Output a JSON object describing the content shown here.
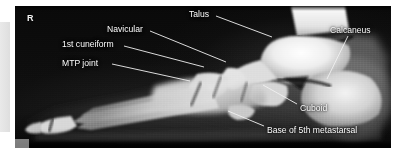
{
  "figure": {
    "modality": "radiograph",
    "view": "lateral foot",
    "side_marker": "R",
    "label_color": "#fdfdfd",
    "leader_color": "#f0f0f0",
    "film_background": "#0a0a0a",
    "bone_color": "#e8e8e8"
  },
  "annotations": [
    {
      "id": "talus",
      "label": "Talus",
      "text_x": 189,
      "text_y": 10,
      "align": "left",
      "leader": {
        "x1": 216,
        "y1": 16,
        "x2": 272,
        "y2": 37
      }
    },
    {
      "id": "navicular",
      "label": "Navicular",
      "text_x": 107,
      "text_y": 25,
      "align": "left",
      "leader": {
        "x1": 150,
        "y1": 31,
        "x2": 226,
        "y2": 62
      }
    },
    {
      "id": "first-cuneiform",
      "label": "1st cuneiform",
      "text_x": 62,
      "text_y": 40,
      "align": "left",
      "leader": {
        "x1": 124,
        "y1": 46,
        "x2": 204,
        "y2": 67
      }
    },
    {
      "id": "mtp-joint",
      "label": "MTP joint",
      "text_x": 62,
      "text_y": 59,
      "align": "left",
      "leader": {
        "x1": 112,
        "y1": 64,
        "x2": 190,
        "y2": 81
      }
    },
    {
      "id": "calcaneus",
      "label": "Calcaneus",
      "text_x": 330,
      "text_y": 26,
      "align": "left",
      "leader": {
        "x1": 348,
        "y1": 36,
        "x2": 327,
        "y2": 79
      }
    },
    {
      "id": "cuboid",
      "label": "Cuboid",
      "text_x": 300,
      "text_y": 105,
      "align": "left",
      "leader": {
        "x1": 297,
        "y1": 104,
        "x2": 263,
        "y2": 85
      }
    },
    {
      "id": "base-5th-metatarsal",
      "label": "Base of 5th metastarsal",
      "text_x": 267,
      "text_y": 127,
      "align": "left",
      "leader": {
        "x1": 264,
        "y1": 126,
        "x2": 228,
        "y2": 111
      }
    }
  ]
}
